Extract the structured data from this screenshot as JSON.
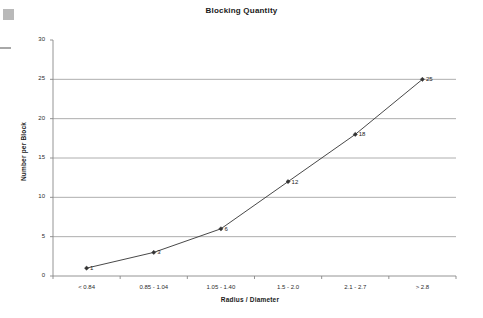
{
  "chart_data": {
    "type": "line",
    "title": "Blocking Quantity",
    "xlabel": "Radius / Diameter",
    "ylabel": "Number per Block",
    "categories": [
      "< 0.84",
      "0.85 - 1.04",
      "1.05 - 1.40",
      "1.5 - 2.0",
      "2.1 - 2.7",
      "> 2.8"
    ],
    "values": [
      1,
      3,
      6,
      12,
      18,
      25
    ],
    "point_labels": [
      "1",
      "3",
      "6",
      "12",
      "18",
      "25"
    ],
    "ylim": [
      0,
      30
    ],
    "ytick_labels": [
      "0",
      "5",
      "10",
      "15",
      "20",
      "25",
      "30"
    ],
    "ytick_values": [
      0,
      5,
      10,
      15,
      20,
      25,
      30
    ],
    "grid": "horizontal",
    "legend": "none",
    "marker": "diamond",
    "line_color": "#333333",
    "grid_color": "#999999",
    "axis_color": "#888888",
    "text_color": "#1a1a1a",
    "background": "#ffffff"
  },
  "artifacts": {
    "square_label": "scan-artifact-square",
    "dash_label": "scan-artifact-dash"
  }
}
